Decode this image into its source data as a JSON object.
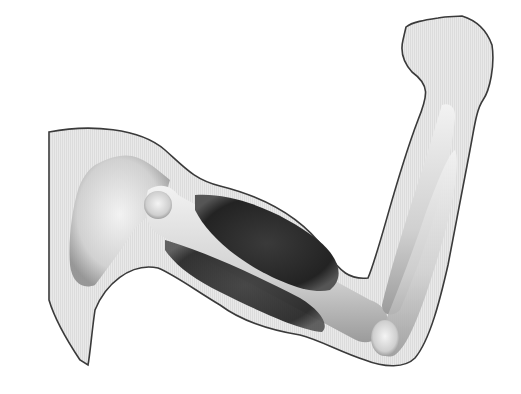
{
  "image": {
    "subject": "Anatomical illustration of a flexed human arm",
    "style": "grayscale drawing",
    "background": "#ffffff",
    "colors": {
      "skin_fill": "#e6e6e6",
      "outline": "#3a3a3a",
      "bone_light": "#f0f0f0",
      "bone_shade": "#9a9a9a",
      "muscle_dark": "#2b2b2b"
    },
    "parts": [
      {
        "name": "arm-outline"
      },
      {
        "name": "fist"
      },
      {
        "name": "scapula"
      },
      {
        "name": "humerus"
      },
      {
        "name": "biceps-muscle"
      },
      {
        "name": "triceps-muscle"
      },
      {
        "name": "radius"
      },
      {
        "name": "ulna"
      }
    ]
  }
}
